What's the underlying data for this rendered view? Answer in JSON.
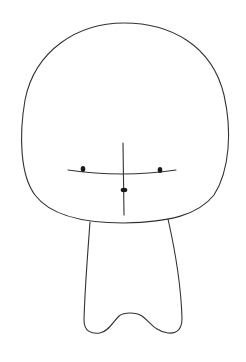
{
  "drawing": {
    "subject": "chibi figure sketch",
    "stroke_color": "#333333",
    "feature_color": "#1a1a1a",
    "background": "#ffffff",
    "parts": [
      "head",
      "face-guide-vertical",
      "face-guide-horizontal",
      "left-eye",
      "right-eye",
      "nose",
      "body"
    ]
  }
}
